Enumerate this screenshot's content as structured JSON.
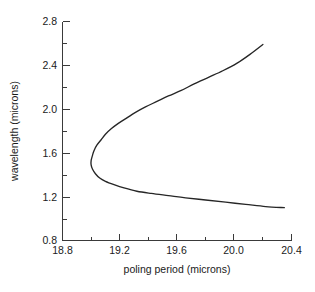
{
  "chart_data": {
    "type": "line",
    "title": "",
    "subtitle": "",
    "xlabel": "poling period (microns)",
    "ylabel": "wavelength (microns)",
    "xlim": [
      18.8,
      20.4
    ],
    "ylim": [
      0.8,
      2.8
    ],
    "xticks": [
      18.8,
      19.2,
      19.6,
      20.0,
      20.4
    ],
    "xticklabels": [
      "18.8",
      "19.2",
      "19.6",
      "20.0",
      "20.4"
    ],
    "yticks": [
      0.8,
      1.2,
      1.6,
      2.0,
      2.4,
      2.8
    ],
    "yticklabels": [
      "0.8",
      "1.2",
      "1.6",
      "2.0",
      "2.4",
      "2.8"
    ],
    "xminorticks": [
      19.0,
      19.4,
      19.8,
      20.2
    ],
    "yminorticks": [
      1.0,
      1.4,
      1.8,
      2.2,
      2.6
    ],
    "grid": false,
    "legend": null,
    "legend_position": "none",
    "annotations": [],
    "series": [
      {
        "name": "phase-matching tuning curve",
        "color": "#262626",
        "linewidth": 1.35,
        "marker": "none",
        "comment": "sideways parabola: turning point at minimum poling period",
        "turning_point": {
          "x": 19.0,
          "y": 1.53
        },
        "upper_branch": [
          {
            "x": 19.0,
            "y": 1.53
          },
          {
            "x": 19.01,
            "y": 1.58
          },
          {
            "x": 19.02,
            "y": 1.62
          },
          {
            "x": 19.04,
            "y": 1.67
          },
          {
            "x": 19.07,
            "y": 1.72
          },
          {
            "x": 19.1,
            "y": 1.77
          },
          {
            "x": 19.14,
            "y": 1.82
          },
          {
            "x": 19.19,
            "y": 1.87
          },
          {
            "x": 19.25,
            "y": 1.92
          },
          {
            "x": 19.31,
            "y": 1.97
          },
          {
            "x": 19.38,
            "y": 2.02
          },
          {
            "x": 19.46,
            "y": 2.07
          },
          {
            "x": 19.54,
            "y": 2.12
          },
          {
            "x": 19.63,
            "y": 2.17
          },
          {
            "x": 19.72,
            "y": 2.23
          },
          {
            "x": 19.82,
            "y": 2.29
          },
          {
            "x": 19.92,
            "y": 2.35
          },
          {
            "x": 20.02,
            "y": 2.42
          },
          {
            "x": 20.11,
            "y": 2.5
          },
          {
            "x": 20.2,
            "y": 2.59
          }
        ],
        "lower_branch": [
          {
            "x": 19.0,
            "y": 1.53
          },
          {
            "x": 19.0,
            "y": 1.49
          },
          {
            "x": 19.01,
            "y": 1.45
          },
          {
            "x": 19.03,
            "y": 1.41
          },
          {
            "x": 19.06,
            "y": 1.37
          },
          {
            "x": 19.1,
            "y": 1.34
          },
          {
            "x": 19.16,
            "y": 1.31
          },
          {
            "x": 19.23,
            "y": 1.28
          },
          {
            "x": 19.32,
            "y": 1.25
          },
          {
            "x": 19.42,
            "y": 1.23
          },
          {
            "x": 19.54,
            "y": 1.21
          },
          {
            "x": 19.66,
            "y": 1.19
          },
          {
            "x": 19.8,
            "y": 1.17
          },
          {
            "x": 19.94,
            "y": 1.15
          },
          {
            "x": 20.08,
            "y": 1.13
          },
          {
            "x": 20.22,
            "y": 1.11
          },
          {
            "x": 20.35,
            "y": 1.1
          }
        ]
      }
    ]
  },
  "figure": {
    "background_color": "#ffffff",
    "axis_color": "#3a3a3a",
    "text_color": "#1a1a1a"
  }
}
